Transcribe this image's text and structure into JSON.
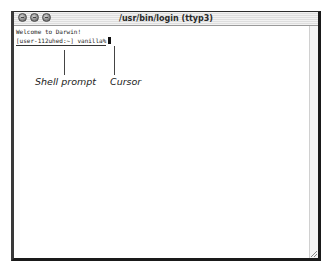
{
  "window": {
    "title": "/usr/bin/login (ttyp3)",
    "traffic_lights": [
      "close-button",
      "minimize-button",
      "zoom-button"
    ]
  },
  "terminal": {
    "lines": [
      "Welcome to Darwin!",
      "[user-112uhed:~] vanilla%"
    ]
  },
  "callouts": {
    "shell_prompt": "Shell prompt",
    "cursor": "Cursor"
  }
}
